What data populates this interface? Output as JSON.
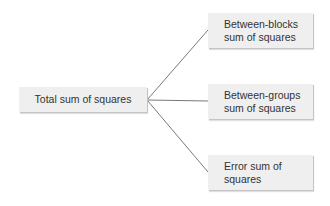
{
  "diagram": {
    "type": "tree",
    "root": {
      "label": "Total sum of squares"
    },
    "children": [
      {
        "line1": "Between-blocks",
        "line2": "sum of squares"
      },
      {
        "line1": "Between-groups",
        "line2": "sum of squares"
      },
      {
        "line1": "Error sum of",
        "line2": "squares"
      }
    ],
    "colors": {
      "box_fill": "#efefef",
      "box_shadow": "#c4c4c4",
      "text": "#333333",
      "connector": "#555555",
      "background": "#ffffff"
    }
  }
}
